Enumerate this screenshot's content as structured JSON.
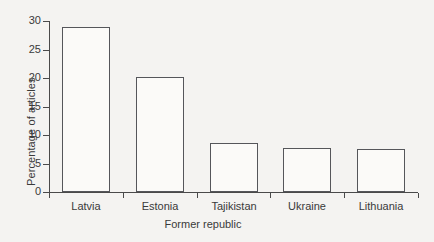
{
  "chart_data": {
    "type": "bar",
    "title": "",
    "subtitle": "",
    "xlabel": "Former republic",
    "ylabel": "Percentage of articles",
    "categories": [
      "Latvia",
      "Estonia",
      "Tajikistan",
      "Ukraine",
      "Lithuania"
    ],
    "values": [
      29.0,
      20.2,
      8.6,
      7.8,
      7.5
    ],
    "series": [
      {
        "name": "Percentage of articles",
        "values": [
          29.0,
          20.2,
          8.6,
          7.8,
          7.5
        ]
      }
    ],
    "ylim": [
      0,
      30
    ],
    "xlim": [
      0,
      5
    ],
    "y_ticks": [
      0,
      5,
      10,
      15,
      20,
      25,
      30
    ],
    "y_tick_labels": [
      "0",
      "5",
      "10",
      "15",
      "20",
      "25",
      "30"
    ],
    "x_tick_labels": [
      "Latvia",
      "Estonia",
      "Tajikistan",
      "Ukraine",
      "Lithuania"
    ],
    "grid": false,
    "legend": false,
    "legend_position": "none",
    "annotations": [],
    "bar_style": {
      "fill": "#fbfaf8",
      "edge": "#55565a",
      "edge_width": 1
    },
    "colors": {
      "background": "#f4f3f1",
      "axis": "#4a4a4a",
      "text": "#3a3a3a",
      "bar_fill": "#fbfaf8",
      "bar_edge": "#55565a"
    }
  },
  "axes": {
    "y_title": "Percentage of articles",
    "x_title": "Former republic",
    "y_tick_labels": [
      "30",
      "25",
      "20",
      "15",
      "10",
      "5",
      "0"
    ]
  }
}
